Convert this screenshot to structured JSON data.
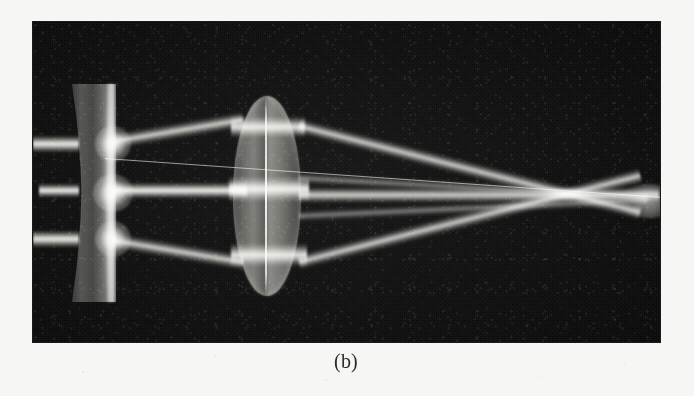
{
  "figure": {
    "caption": "(b)",
    "panel_label": "b",
    "background_color": "#f6f6f4",
    "photo_background_color": "#0a0a0a",
    "beam_color": "#f4f4ee",
    "glass_color": "#a8a8a2"
  },
  "photo": {
    "frame": {
      "left": 33,
      "top": 22,
      "width": 627,
      "height": 320
    },
    "optical_elements": [
      {
        "name": "diverging-lens",
        "type": "biconcave",
        "label": "concave diverging lens",
        "left": 72,
        "top": 84,
        "width": 45,
        "height": 218
      },
      {
        "name": "converging-lens",
        "type": "biconvex-doublet",
        "label": "thick convex converging doublet",
        "left": 234,
        "top": 96,
        "width": 68,
        "height": 200
      }
    ],
    "beams": {
      "count": 3,
      "incoming_label": "three parallel collimated beams",
      "entry_y": [
        145,
        192,
        240
      ],
      "focal_point": {
        "x": 645,
        "y": 206
      },
      "outgoing_label": "rays converging to a focus at the right"
    },
    "reference_line": {
      "name": "alignment-filament",
      "label": "thin diagonal alignment filament"
    }
  }
}
